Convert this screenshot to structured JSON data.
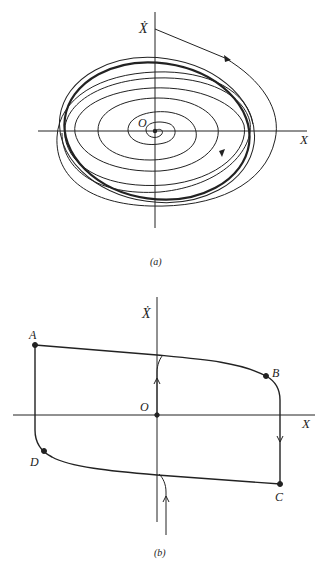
{
  "figure_a": {
    "caption": "(a)",
    "x_axis_label": "X",
    "y_axis_label": "Ẋ",
    "origin_label": "O",
    "description": "Phase-plane trajectories spiralling out from origin and inward from outside onto a stable limit cycle"
  },
  "figure_b": {
    "caption": "(b)",
    "x_axis_label": "X",
    "y_axis_label": "Ẋ",
    "origin_label": "O",
    "points": [
      {
        "label": "A"
      },
      {
        "label": "B"
      },
      {
        "label": "C"
      },
      {
        "label": "D"
      }
    ],
    "description": "Relaxation-oscillation limit cycle ABCD with fast vertical jumps"
  },
  "colors": {
    "ink": "#222222",
    "background": "#ffffff"
  }
}
